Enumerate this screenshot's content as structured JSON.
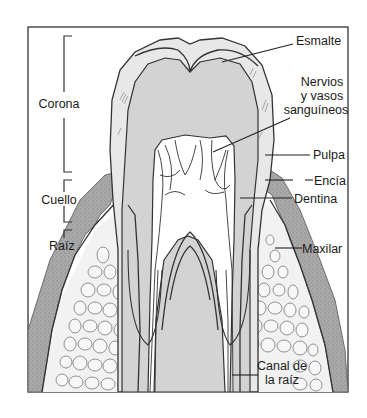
{
  "diagram": {
    "regions": {
      "crown": "Corona",
      "neck": "Cuello",
      "root": "Raíz"
    },
    "labels": {
      "enamel": "Esmalte",
      "nerves_line1": "Nervios",
      "nerves_line2": "y vasos",
      "nerves_line3": "sanguíneos",
      "pulp": "Pulpa",
      "gum": "Encía",
      "dentin": "Dentina",
      "jaw": "Maxilar",
      "root_canal_line1": "Canal de",
      "root_canal_line2": "la raíz"
    },
    "colors": {
      "frame": "#333333",
      "enamel": "#e6e6e6",
      "dentin": "#cfcfcf",
      "pulp": "#ffffff",
      "gum": "#a8a8a8",
      "bone": "#f0f0f0",
      "background": "#ffffff"
    }
  }
}
